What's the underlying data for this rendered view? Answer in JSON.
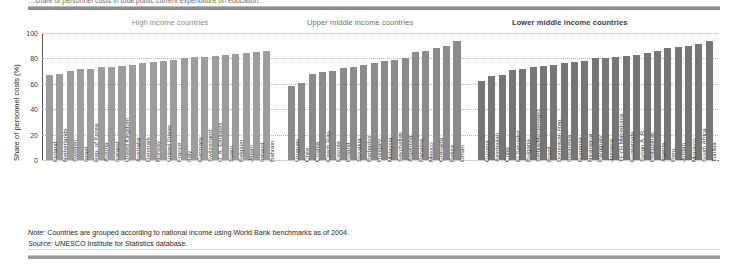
{
  "page": {
    "cutoff_title": "…share of personnel costs in total public current expenditure on education…",
    "note_lead": "Note:",
    "note_text": " Countries are grouped according to national income using World Bank benchmarks as of 2004.",
    "source_lead": "Source:",
    "source_text": " UNESCO Institute for Statistics database."
  },
  "chart_data": {
    "type": "bar",
    "title": "",
    "xlabel": "",
    "ylabel": "Share of personnel costs (%)",
    "ylim": [
      0,
      100
    ],
    "yticks": [
      0,
      20,
      40,
      60,
      80,
      100
    ],
    "grid": true,
    "legend": "none",
    "bar_color": "#8f8f8f",
    "groups": [
      {
        "name": "High income countries",
        "categories": [
          "Finland",
          "Netherlands",
          "Sweden",
          "Israel",
          "Rep. of Korea",
          "Austria",
          "Iceland",
          "United Kingdom",
          "Australia",
          "Denmark",
          "Norway",
          "United States",
          "France",
          "Italy",
          "Germany",
          "Switzerland",
          "U. A. Emirates",
          "Spain",
          "Belgium",
          "Japan",
          "Ireland",
          "Bahrain"
        ],
        "values": [
          67,
          68,
          70,
          72,
          72,
          73,
          73.5,
          74,
          74.5,
          76,
          77.5,
          78,
          79,
          80,
          81,
          81,
          82,
          83,
          83.5,
          84.5,
          85,
          86
        ]
      },
      {
        "name": "Upper middle income countries",
        "categories": [
          "Uruguay",
          "Chile",
          "Croatia",
          "Czech Rep.",
          "Estonia",
          "Poland",
          "Slovakia",
          "Barbados",
          "Hungary",
          "Malaysia",
          "Seychelles",
          "Argentina",
          "Panama",
          "Mexico",
          "Grenada",
          "Belize",
          "Oman"
        ],
        "values": [
          58,
          61,
          68,
          69,
          70,
          72.5,
          73.5,
          74.5,
          76,
          78,
          79,
          80,
          85,
          86,
          88,
          90,
          94
        ]
      },
      {
        "name": "Lower middle income countries",
        "categories": [
          "Guyana",
          "Azerbaijan",
          "Cuba",
          "El Salvador",
          "Bulgaria",
          "Serbia/Montenegro",
          "Brazil",
          "Dominican Rep.",
          "Indonesia",
          "Romania",
          "Nicaragua",
          "Paraguay",
          "Jamaica",
          "TFYR Macedonia",
          "Guatemala",
          "Syrian A. R.",
          "Philippines",
          "Algeria",
          "Peru",
          "Jordan",
          "Morocco",
          "South Africa",
          "Tunisia"
        ],
        "values": [
          62,
          66,
          67,
          71,
          72,
          73,
          74,
          75,
          76,
          77,
          78,
          80,
          80.5,
          81,
          82,
          83,
          84,
          85.5,
          88,
          89,
          90,
          91,
          94
        ]
      }
    ]
  }
}
